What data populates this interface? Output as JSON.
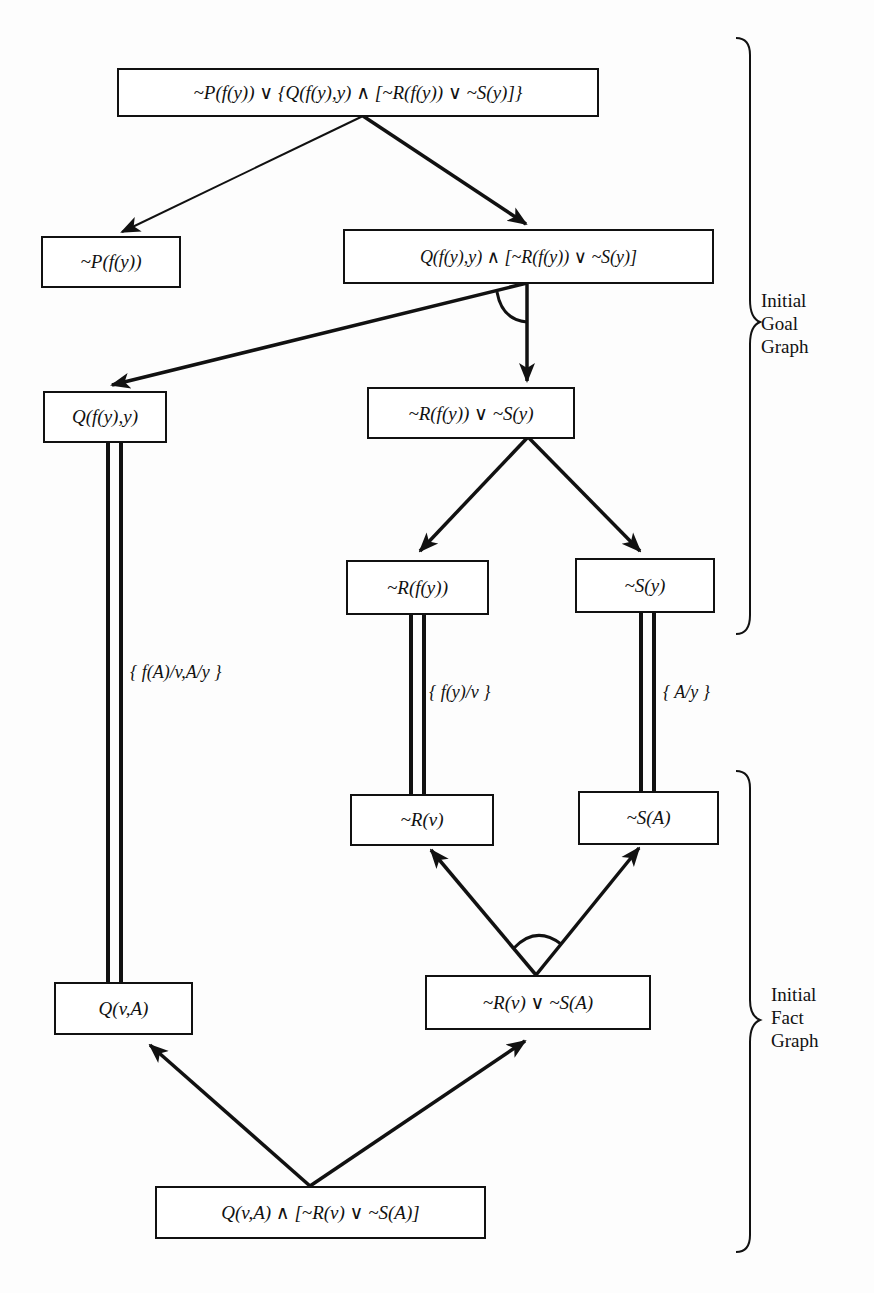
{
  "diagram": {
    "type": "AND/OR goal-fact graph",
    "nodes": {
      "root_goal": "~P(f(y))  ∨ {Q(f(y),y) ∧ [~R(f(y)) ∨ ~S(y)]}",
      "goal_not_p": "~P(f(y))",
      "goal_conj": "Q(f(y),y) ∧ [~R(f(y)) ∨ ~S(y)]",
      "goal_q": "Q(f(y),y)",
      "goal_disj": "~R(f(y)) ∨ ~S(y)",
      "goal_not_r": "~R(f(y))",
      "goal_not_s": "~S(y)",
      "fact_not_r": "~R(v)",
      "fact_not_s": "~S(A)",
      "fact_q": "Q(v,A)",
      "fact_disj": "~R(v) ∨ ~S(A)",
      "fact_root": "Q(v,A) ∧ [~R(v) ∨ ~S(A)]"
    },
    "match_labels": {
      "q_match": "{ f(A)/v,A/y }",
      "r_match": "{ f(y)/v }",
      "s_match": "{ A/y }"
    },
    "groups": {
      "goal_graph": "Initial\nGoal\nGraph",
      "fact_graph": "Initial\nFact\nGraph"
    },
    "edges": [
      {
        "from": "root_goal",
        "to": "goal_not_p",
        "kind": "or"
      },
      {
        "from": "root_goal",
        "to": "goal_conj",
        "kind": "or"
      },
      {
        "from": "goal_conj",
        "to": "goal_q",
        "kind": "and"
      },
      {
        "from": "goal_conj",
        "to": "goal_disj",
        "kind": "and"
      },
      {
        "from": "goal_disj",
        "to": "goal_not_r",
        "kind": "or"
      },
      {
        "from": "goal_disj",
        "to": "goal_not_s",
        "kind": "or"
      },
      {
        "from": "fact_disj",
        "to": "fact_not_r",
        "kind": "and"
      },
      {
        "from": "fact_disj",
        "to": "fact_not_s",
        "kind": "and"
      },
      {
        "from": "fact_root",
        "to": "fact_q",
        "kind": "or"
      },
      {
        "from": "fact_root",
        "to": "fact_disj",
        "kind": "or"
      }
    ],
    "matches": [
      {
        "goal": "goal_q",
        "fact": "fact_q",
        "label": "{ f(A)/v,A/y }"
      },
      {
        "goal": "goal_not_r",
        "fact": "fact_not_r",
        "label": "{ f(y)/v }"
      },
      {
        "goal": "goal_not_s",
        "fact": "fact_not_s",
        "label": "{ A/y }"
      }
    ]
  }
}
